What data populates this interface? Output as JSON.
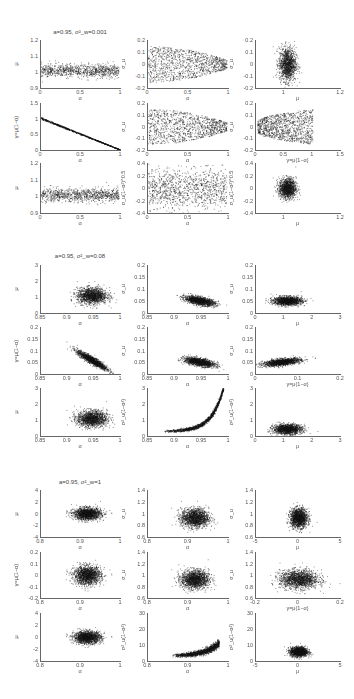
{
  "figure": {
    "blocks": [
      {
        "title": "a=0.95, σ²_w=0.001"
      },
      {
        "title": "a=0.95, σ²_w=0.08"
      },
      {
        "title": "a=0.95, σ²_w=1"
      }
    ]
  },
  "chart_data": [
    {
      "type": "scatter",
      "block_title": "a=0.95, σ²_w=0.001",
      "panels": [
        {
          "row": 0,
          "col": 0,
          "xlabel": "α",
          "ylabel": "μ",
          "xlim": [
            0,
            1
          ],
          "ylim": [
            0.9,
            1.2
          ],
          "xticks": [
            "0",
            "0.5",
            "1"
          ],
          "yticks": [
            "0.9",
            "1",
            "1.1",
            "1.2"
          ],
          "shape": "uniform_band",
          "x": [
            0,
            0.97
          ],
          "y_center": 1.01,
          "y_spread": 0.02,
          "n": 900
        },
        {
          "row": 0,
          "col": 1,
          "xlabel": "α",
          "ylabel": "σ_u",
          "xlim": [
            0,
            1
          ],
          "ylim": [
            -0.2,
            0.2
          ],
          "xticks": [
            "0",
            "0.5",
            "1"
          ],
          "yticks": [
            "-0.2",
            "-0.1",
            "0",
            "0.1",
            "0.2"
          ],
          "shape": "cone",
          "x": [
            0,
            0.97
          ],
          "y_center": 0,
          "y_spread": 0.15,
          "n": 1100
        },
        {
          "row": 0,
          "col": 2,
          "xlabel": "μ",
          "ylabel": "σ_u",
          "xlim": [
            0.9,
            1.2
          ],
          "ylim": [
            -0.2,
            0.2
          ],
          "xticks": [
            "1",
            "1.2"
          ],
          "yticks": [
            "-0.2",
            "-0.1",
            "0",
            "0.1",
            "0.2"
          ],
          "shape": "gauss",
          "x_center": 1.01,
          "x_spread": 0.015,
          "y_center": 0,
          "y_spread": 0.07,
          "n": 1300
        },
        {
          "row": 1,
          "col": 0,
          "xlabel": "α",
          "ylabel": "γ=μ(1−α)",
          "xlim": [
            0,
            1
          ],
          "ylim": [
            0,
            1.5
          ],
          "xticks": [
            "0",
            "0.5",
            "1"
          ],
          "yticks": [
            "0",
            "0.5",
            "1",
            "1.5"
          ],
          "shape": "line",
          "x": [
            0,
            1
          ],
          "y_from": 1.02,
          "y_to": 0,
          "y_spread": 0.015,
          "n": 900
        },
        {
          "row": 1,
          "col": 1,
          "xlabel": "α",
          "ylabel": "σ_u",
          "xlim": [
            0,
            1
          ],
          "ylim": [
            -0.2,
            0.2
          ],
          "xticks": [
            "0",
            "0.5",
            "1"
          ],
          "yticks": [
            "-0.2",
            "-0.1",
            "0",
            "0.1",
            "0.2"
          ],
          "shape": "cone",
          "x": [
            0,
            0.97
          ],
          "y_center": 0,
          "y_spread": 0.15,
          "n": 1100
        },
        {
          "row": 1,
          "col": 2,
          "xlabel": "γ=μ(1−α)",
          "ylabel": "σ_u",
          "xlim": [
            0,
            1.5
          ],
          "ylim": [
            -0.2,
            0.2
          ],
          "xticks": [
            "0",
            "0.5",
            "1",
            "1.5"
          ],
          "yticks": [
            "-0.2",
            "-0.1",
            "0",
            "0.1",
            "0.2"
          ],
          "shape": "cone_rev",
          "x": [
            0.02,
            1.0
          ],
          "y_center": 0,
          "y_spread": 0.15,
          "n": 1100
        },
        {
          "row": 2,
          "col": 0,
          "xlabel": "α",
          "ylabel": "μ",
          "xlim": [
            0,
            1
          ],
          "ylim": [
            0.9,
            1.2
          ],
          "xticks": [
            "0",
            "0.5",
            "1"
          ],
          "yticks": [
            "0.9",
            "1",
            "1.1",
            "1.2"
          ],
          "shape": "uniform_band",
          "x": [
            0,
            0.97
          ],
          "y_center": 1.01,
          "y_spread": 0.02,
          "n": 900
        },
        {
          "row": 2,
          "col": 1,
          "xlabel": "α",
          "ylabel": "σ_u(1−α²)^0.5",
          "xlim": [
            0,
            1
          ],
          "ylim": [
            -0.4,
            0.4
          ],
          "xticks": [
            "0",
            "0.5",
            "1"
          ],
          "yticks": [
            "-0.4",
            "-0.2",
            "0",
            "0.2",
            "0.4"
          ],
          "shape": "uniform_band",
          "x": [
            0,
            0.97
          ],
          "y_center": 0,
          "y_spread": 0.16,
          "n": 1100
        },
        {
          "row": 2,
          "col": 2,
          "xlabel": "μ",
          "ylabel": "σ_u(1−α²)^0.5",
          "xlim": [
            0.9,
            1.2
          ],
          "ylim": [
            -0.4,
            0.4
          ],
          "xticks": [
            "1",
            "1.2"
          ],
          "yticks": [
            "-0.4",
            "-0.2",
            "0",
            "0.2",
            "0.4"
          ],
          "shape": "gauss",
          "x_center": 1.01,
          "x_spread": 0.015,
          "y_center": 0,
          "y_spread": 0.08,
          "n": 1300
        }
      ]
    },
    {
      "type": "scatter",
      "block_title": "a=0.95, σ²_w=0.08",
      "panels": [
        {
          "row": 0,
          "col": 0,
          "xlabel": "α",
          "ylabel": "μ",
          "xlim": [
            0.85,
            1
          ],
          "ylim": [
            0,
            3
          ],
          "xticks": [
            "0.85",
            "0.9",
            "0.95",
            "1"
          ],
          "yticks": [
            "0",
            "1",
            "2",
            "3"
          ],
          "shape": "gauss",
          "x_center": 0.945,
          "x_spread": 0.014,
          "y_center": 1.1,
          "y_spread": 0.25,
          "n": 1500
        },
        {
          "row": 0,
          "col": 1,
          "xlabel": "α",
          "ylabel": "σ_u",
          "xlim": [
            0.85,
            1
          ],
          "ylim": [
            0,
            0.2
          ],
          "xticks": [
            "0.85",
            "0.9",
            "0.95",
            "1"
          ],
          "yticks": [
            "0",
            "0.05",
            "0.1",
            "0.15",
            "0.2"
          ],
          "shape": "gauss_slope",
          "x_center": 0.945,
          "x_spread": 0.014,
          "y_center": 0.052,
          "y_spread": 0.008,
          "slope": -0.4,
          "n": 1500
        },
        {
          "row": 0,
          "col": 2,
          "xlabel": "μ",
          "ylabel": "σ_u",
          "xlim": [
            0,
            3
          ],
          "ylim": [
            0,
            0.2
          ],
          "xticks": [
            "0",
            "1",
            "2",
            "3"
          ],
          "yticks": [
            "0",
            "0.05",
            "0.1",
            "0.15",
            "0.2"
          ],
          "shape": "gauss",
          "x_center": 1.1,
          "x_spread": 0.25,
          "y_center": 0.052,
          "y_spread": 0.009,
          "n": 1500
        },
        {
          "row": 1,
          "col": 0,
          "xlabel": "α",
          "ylabel": "γ=μ(1−α)",
          "xlim": [
            0.85,
            1
          ],
          "ylim": [
            0,
            0.2
          ],
          "xticks": [
            "0.85",
            "0.9",
            "0.95",
            "1"
          ],
          "yticks": [
            "0",
            "0.05",
            "0.1",
            "0.15",
            "0.2"
          ],
          "shape": "gauss_slope",
          "x_center": 0.945,
          "x_spread": 0.014,
          "y_center": 0.06,
          "y_spread": 0.008,
          "slope": -1.3,
          "n": 1500
        },
        {
          "row": 1,
          "col": 1,
          "xlabel": "α",
          "ylabel": "σ_u",
          "xlim": [
            0.85,
            1
          ],
          "ylim": [
            0,
            0.2
          ],
          "xticks": [
            "0.85",
            "0.9",
            "0.95",
            "1"
          ],
          "yticks": [
            "0",
            "0.05",
            "0.1",
            "0.15",
            "0.2"
          ],
          "shape": "gauss_slope",
          "x_center": 0.945,
          "x_spread": 0.014,
          "y_center": 0.052,
          "y_spread": 0.008,
          "slope": -0.4,
          "n": 1500
        },
        {
          "row": 1,
          "col": 2,
          "xlabel": "γ=μ(1−α)",
          "ylabel": "σ_u",
          "xlim": [
            0,
            0.2
          ],
          "ylim": [
            0,
            0.2
          ],
          "xticks": [
            "0",
            "0.1",
            "0.2"
          ],
          "yticks": [
            "0",
            "0.05",
            "0.1",
            "0.15",
            "0.2"
          ],
          "shape": "gauss_slope",
          "x_center": 0.06,
          "x_spread": 0.022,
          "y_center": 0.052,
          "y_spread": 0.007,
          "slope": 0.2,
          "n": 1500
        },
        {
          "row": 2,
          "col": 0,
          "xlabel": "α",
          "ylabel": "μ",
          "xlim": [
            0.85,
            1
          ],
          "ylim": [
            0,
            3
          ],
          "xticks": [
            "0.85",
            "0.9",
            "0.95",
            "1"
          ],
          "yticks": [
            "0",
            "1",
            "2",
            "3"
          ],
          "shape": "gauss",
          "x_center": 0.945,
          "x_spread": 0.014,
          "y_center": 1.1,
          "y_spread": 0.25,
          "n": 1500
        },
        {
          "row": 2,
          "col": 1,
          "xlabel": "α",
          "ylabel": "σ²_u(1−α²)",
          "xlim": [
            0.85,
            1
          ],
          "ylim": [
            0,
            3
          ],
          "xticks": [
            "0.85",
            "0.9",
            "0.95",
            "1"
          ],
          "yticks": [
            "0",
            "1",
            "2",
            "3"
          ],
          "shape": "exp_curve",
          "x": [
            0.88,
            0.99
          ],
          "y_base": 0.3,
          "y_scale": 0.02,
          "y_rate": 45,
          "y_spread": 0.06,
          "n": 1400
        },
        {
          "row": 2,
          "col": 2,
          "xlabel": "μ",
          "ylabel": "σ²_u(1−α²)",
          "xlim": [
            0,
            3
          ],
          "ylim": [
            0,
            3
          ],
          "xticks": [
            "0",
            "1",
            "2",
            "3"
          ],
          "yticks": [
            "0",
            "1",
            "2",
            "3"
          ],
          "shape": "gauss",
          "x_center": 1.1,
          "x_spread": 0.25,
          "y_center": 0.45,
          "y_spread": 0.15,
          "n": 1500
        }
      ]
    },
    {
      "type": "scatter",
      "block_title": "a=0.95, σ²_w=1",
      "panels": [
        {
          "row": 0,
          "col": 0,
          "xlabel": "α",
          "ylabel": "μ",
          "xlim": [
            0.8,
            1
          ],
          "ylim": [
            -4,
            4
          ],
          "xticks": [
            "0.8",
            "0.9",
            "1"
          ],
          "yticks": [
            "-4",
            "-2",
            "0",
            "2",
            "4"
          ],
          "shape": "gauss",
          "x_center": 0.915,
          "x_spread": 0.017,
          "y_center": 0,
          "y_spread": 0.5,
          "n": 1600
        },
        {
          "row": 0,
          "col": 1,
          "xlabel": "α",
          "ylabel": "σ_u",
          "xlim": [
            0.8,
            1
          ],
          "ylim": [
            0.6,
            1.4
          ],
          "xticks": [
            "0.8",
            "0.9",
            "1"
          ],
          "yticks": [
            "0.6",
            "0.8",
            "1",
            "1.2",
            "1.4"
          ],
          "shape": "gauss",
          "x_center": 0.915,
          "x_spread": 0.017,
          "y_center": 0.93,
          "y_spread": 0.08,
          "n": 1600
        },
        {
          "row": 0,
          "col": 2,
          "xlabel": "μ",
          "ylabel": "σ_u",
          "xlim": [
            -5,
            5
          ],
          "ylim": [
            0.6,
            1.4
          ],
          "xticks": [
            "-5",
            "0",
            "5"
          ],
          "yticks": [
            "0.6",
            "0.8",
            "1",
            "1.2",
            "1.4"
          ],
          "shape": "gauss",
          "x_center": 0,
          "x_spread": 0.5,
          "y_center": 0.93,
          "y_spread": 0.08,
          "n": 1600
        },
        {
          "row": 1,
          "col": 0,
          "xlabel": "α",
          "ylabel": "γ=μ(1−α)",
          "xlim": [
            0.8,
            1
          ],
          "ylim": [
            -0.2,
            0.2
          ],
          "xticks": [
            "0.8",
            "0.9",
            "1"
          ],
          "yticks": [
            "-0.2",
            "-0.1",
            "0",
            "0.1",
            "0.2"
          ],
          "shape": "gauss",
          "x_center": 0.915,
          "x_spread": 0.017,
          "y_center": 0,
          "y_spread": 0.04,
          "n": 1600
        },
        {
          "row": 1,
          "col": 1,
          "xlabel": "α",
          "ylabel": "σ_u",
          "xlim": [
            0.8,
            1
          ],
          "ylim": [
            0.6,
            1.4
          ],
          "xticks": [
            "0.8",
            "0.9",
            "1"
          ],
          "yticks": [
            "0.6",
            "0.8",
            "1",
            "1.2",
            "1.4"
          ],
          "shape": "gauss",
          "x_center": 0.915,
          "x_spread": 0.017,
          "y_center": 0.93,
          "y_spread": 0.08,
          "n": 1600
        },
        {
          "row": 1,
          "col": 2,
          "xlabel": "γ=μ(1−α)",
          "ylabel": "σ_u",
          "xlim": [
            -0.2,
            0.2
          ],
          "ylim": [
            0.6,
            1.4
          ],
          "xticks": [
            "-0.2",
            "0",
            "0.2"
          ],
          "yticks": [
            "0.6",
            "0.8",
            "1",
            "1.2",
            "1.4"
          ],
          "shape": "gauss",
          "x_center": 0,
          "x_spread": 0.045,
          "y_center": 0.93,
          "y_spread": 0.08,
          "n": 1600
        },
        {
          "row": 2,
          "col": 0,
          "xlabel": "α",
          "ylabel": "μ",
          "xlim": [
            0.8,
            1
          ],
          "ylim": [
            -4,
            4
          ],
          "xticks": [
            "0.8",
            "0.9",
            "1"
          ],
          "yticks": [
            "-4",
            "-2",
            "0",
            "2",
            "4"
          ],
          "shape": "gauss",
          "x_center": 0.915,
          "x_spread": 0.017,
          "y_center": 0,
          "y_spread": 0.5,
          "n": 1600
        },
        {
          "row": 2,
          "col": 1,
          "xlabel": "α",
          "ylabel": "σ²_u(1−α²)",
          "xlim": [
            0.8,
            1
          ],
          "ylim": [
            0,
            30
          ],
          "xticks": [
            "0.8",
            "0.9",
            "1"
          ],
          "yticks": [
            "0",
            "10",
            "20",
            "30"
          ],
          "shape": "exp_curve",
          "x": [
            0.86,
            0.975
          ],
          "y_base": 3.5,
          "y_scale": 0.25,
          "y_rate": 30,
          "y_spread": 0.8,
          "n": 1500
        },
        {
          "row": 2,
          "col": 2,
          "xlabel": "μ",
          "ylabel": "σ²_u(1−α²)",
          "xlim": [
            -5,
            5
          ],
          "ylim": [
            0,
            30
          ],
          "xticks": [
            "-5",
            "0",
            "5"
          ],
          "yticks": [
            "0",
            "10",
            "20",
            "30"
          ],
          "shape": "gauss",
          "x_center": 0,
          "x_spread": 0.5,
          "y_center": 6,
          "y_spread": 1.5,
          "n": 1600
        }
      ]
    }
  ]
}
